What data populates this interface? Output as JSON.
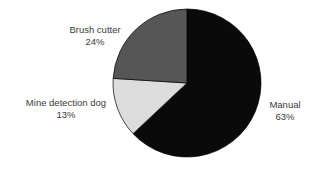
{
  "chart_data": {
    "type": "pie",
    "title": "",
    "subtitle": "",
    "xlabel": "",
    "ylabel": "",
    "legend_position": "none",
    "grid": false,
    "labels_inline": true,
    "background_color": "#FFFFFF",
    "text_color": "#3A3A3A",
    "start_angle_deg": 0,
    "direction": "clockwise",
    "categories": [
      "Manual",
      "Mine detection dog",
      "Brush cutter"
    ],
    "values": [
      63,
      13,
      24
    ],
    "value_suffix": "%",
    "colors": [
      "#0A0A0A",
      "#DCDCDC",
      "#565656"
    ],
    "slices": [
      {
        "name": "Manual",
        "label": "Manual",
        "value": 63,
        "value_label": "63%",
        "color": "#0A0A0A",
        "start_deg": 0,
        "end_deg": 226.8
      },
      {
        "name": "Mine detection dog",
        "label": "Mine detection dog",
        "value": 13,
        "value_label": "13%",
        "color": "#DCDCDC",
        "start_deg": 226.8,
        "end_deg": 273.6
      },
      {
        "name": "Brush cutter",
        "label": "Brush cutter",
        "value": 24,
        "value_label": "24%",
        "color": "#565656",
        "start_deg": 273.6,
        "end_deg": 360
      }
    ],
    "geometry": {
      "center_x": 187,
      "center_y": 83,
      "radius": 74
    }
  }
}
